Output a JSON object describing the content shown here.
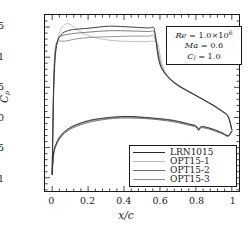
{
  "chart_data": {
    "type": "line",
    "title": "",
    "xlabel": "x/c",
    "ylabel": "Cp",
    "xlim": [
      -0.04,
      1.04
    ],
    "ylim": [
      -1.7,
      1.22
    ],
    "y_inverted": true,
    "grid": false,
    "xticks": [
      "0",
      "0.2",
      "0.4",
      "0.6",
      "0.8",
      "1"
    ],
    "xtick_values": [
      0,
      0.2,
      0.4,
      0.6,
      0.8,
      1
    ],
    "yticks": [
      "-1.5",
      "-1",
      "-0.5",
      "0",
      "0.5",
      "1"
    ],
    "ytick_values": [
      -1.5,
      -1,
      -0.5,
      0,
      0.5,
      1
    ],
    "legend_position": "bottom-right",
    "series": [
      {
        "name": "LRN1015",
        "color": "#2b2b2b",
        "upper_surface": [
          [
            0.0,
            0.95
          ],
          [
            0.004,
            0.2
          ],
          [
            0.008,
            -0.45
          ],
          [
            0.014,
            -0.9
          ],
          [
            0.022,
            -1.15
          ],
          [
            0.034,
            -1.3
          ],
          [
            0.05,
            -1.375
          ],
          [
            0.07,
            -1.42
          ],
          [
            0.1,
            -1.45
          ],
          [
            0.14,
            -1.465
          ],
          [
            0.2,
            -1.48
          ],
          [
            0.26,
            -1.5
          ],
          [
            0.32,
            -1.515
          ],
          [
            0.38,
            -1.51
          ],
          [
            0.44,
            -1.5
          ],
          [
            0.5,
            -1.49
          ],
          [
            0.54,
            -1.485
          ],
          [
            0.565,
            -1.49
          ],
          [
            0.575,
            -1.35
          ],
          [
            0.585,
            -1.1
          ],
          [
            0.6,
            -0.88
          ],
          [
            0.63,
            -0.72
          ],
          [
            0.67,
            -0.6
          ],
          [
            0.72,
            -0.5
          ],
          [
            0.78,
            -0.4
          ],
          [
            0.84,
            -0.3
          ],
          [
            0.9,
            -0.2
          ],
          [
            0.95,
            -0.1
          ],
          [
            0.98,
            -0.02
          ],
          [
            1.0,
            0.2
          ]
        ],
        "lower_surface": [
          [
            0.0,
            0.95
          ],
          [
            0.004,
            0.72
          ],
          [
            0.01,
            0.55
          ],
          [
            0.02,
            0.45
          ],
          [
            0.04,
            0.33
          ],
          [
            0.07,
            0.23
          ],
          [
            0.11,
            0.15
          ],
          [
            0.16,
            0.09
          ],
          [
            0.22,
            0.04
          ],
          [
            0.3,
            0.005
          ],
          [
            0.38,
            -0.015
          ],
          [
            0.45,
            -0.015
          ],
          [
            0.52,
            0.0
          ],
          [
            0.6,
            0.02
          ],
          [
            0.68,
            0.05
          ],
          [
            0.75,
            0.1
          ],
          [
            0.8,
            0.14
          ],
          [
            0.815,
            0.2
          ],
          [
            0.83,
            0.15
          ],
          [
            0.87,
            0.17
          ],
          [
            0.91,
            0.21
          ],
          [
            0.95,
            0.26
          ],
          [
            0.98,
            0.3
          ],
          [
            1.0,
            0.22
          ]
        ]
      },
      {
        "name": "OPT15-1",
        "color": "#b9b9b9",
        "upper_surface": [
          [
            0.0,
            0.9
          ],
          [
            0.004,
            0.15
          ],
          [
            0.01,
            -0.55
          ],
          [
            0.018,
            -1.0
          ],
          [
            0.028,
            -1.25
          ],
          [
            0.042,
            -1.42
          ],
          [
            0.06,
            -1.52
          ],
          [
            0.08,
            -1.555
          ],
          [
            0.1,
            -1.545
          ],
          [
            0.13,
            -1.48
          ],
          [
            0.17,
            -1.4
          ],
          [
            0.22,
            -1.34
          ],
          [
            0.28,
            -1.3
          ],
          [
            0.34,
            -1.275
          ],
          [
            0.4,
            -1.265
          ],
          [
            0.46,
            -1.26
          ],
          [
            0.52,
            -1.26
          ],
          [
            0.56,
            -1.265
          ],
          [
            0.585,
            -1.24
          ],
          [
            0.6,
            -1.05
          ],
          [
            0.615,
            -0.85
          ],
          [
            0.64,
            -0.7
          ],
          [
            0.68,
            -0.58
          ],
          [
            0.73,
            -0.48
          ],
          [
            0.79,
            -0.38
          ],
          [
            0.85,
            -0.28
          ],
          [
            0.9,
            -0.19
          ],
          [
            0.95,
            -0.09
          ],
          [
            0.98,
            -0.01
          ],
          [
            1.0,
            0.2
          ]
        ],
        "lower_surface": [
          [
            0.0,
            0.9
          ],
          [
            0.004,
            0.7
          ],
          [
            0.01,
            0.56
          ],
          [
            0.02,
            0.47
          ],
          [
            0.04,
            0.35
          ],
          [
            0.07,
            0.25
          ],
          [
            0.11,
            0.17
          ],
          [
            0.16,
            0.11
          ],
          [
            0.22,
            0.06
          ],
          [
            0.3,
            0.02
          ],
          [
            0.38,
            0.0
          ],
          [
            0.45,
            0.0
          ],
          [
            0.52,
            0.01
          ],
          [
            0.6,
            0.035
          ],
          [
            0.68,
            0.07
          ],
          [
            0.75,
            0.115
          ],
          [
            0.8,
            0.155
          ],
          [
            0.815,
            0.21
          ],
          [
            0.83,
            0.165
          ],
          [
            0.87,
            0.185
          ],
          [
            0.91,
            0.225
          ],
          [
            0.95,
            0.27
          ],
          [
            0.98,
            0.31
          ],
          [
            1.0,
            0.23
          ]
        ]
      },
      {
        "name": "OPT15-2",
        "color": "#6e6e6e",
        "upper_surface": [
          [
            0.0,
            0.93
          ],
          [
            0.004,
            0.18
          ],
          [
            0.008,
            -0.5
          ],
          [
            0.014,
            -0.95
          ],
          [
            0.022,
            -1.18
          ],
          [
            0.034,
            -1.3
          ],
          [
            0.05,
            -1.35
          ],
          [
            0.07,
            -1.37
          ],
          [
            0.1,
            -1.385
          ],
          [
            0.14,
            -1.4
          ],
          [
            0.2,
            -1.415
          ],
          [
            0.26,
            -1.43
          ],
          [
            0.32,
            -1.44
          ],
          [
            0.38,
            -1.44
          ],
          [
            0.44,
            -1.435
          ],
          [
            0.5,
            -1.43
          ],
          [
            0.54,
            -1.425
          ],
          [
            0.565,
            -1.43
          ],
          [
            0.578,
            -1.3
          ],
          [
            0.59,
            -1.05
          ],
          [
            0.605,
            -0.85
          ],
          [
            0.635,
            -0.7
          ],
          [
            0.675,
            -0.58
          ],
          [
            0.725,
            -0.48
          ],
          [
            0.785,
            -0.385
          ],
          [
            0.845,
            -0.285
          ],
          [
            0.9,
            -0.19
          ],
          [
            0.95,
            -0.09
          ],
          [
            0.98,
            -0.01
          ],
          [
            1.0,
            0.2
          ]
        ],
        "lower_surface": [
          [
            0.0,
            0.93
          ],
          [
            0.004,
            0.74
          ],
          [
            0.01,
            0.58
          ],
          [
            0.02,
            0.48
          ],
          [
            0.04,
            0.36
          ],
          [
            0.07,
            0.26
          ],
          [
            0.11,
            0.18
          ],
          [
            0.16,
            0.12
          ],
          [
            0.22,
            0.07
          ],
          [
            0.3,
            0.03
          ],
          [
            0.38,
            0.01
          ],
          [
            0.45,
            0.01
          ],
          [
            0.52,
            0.02
          ],
          [
            0.6,
            0.04
          ],
          [
            0.68,
            0.075
          ],
          [
            0.75,
            0.12
          ],
          [
            0.8,
            0.16
          ],
          [
            0.815,
            0.215
          ],
          [
            0.83,
            0.17
          ],
          [
            0.87,
            0.19
          ],
          [
            0.91,
            0.23
          ],
          [
            0.95,
            0.275
          ],
          [
            0.98,
            0.315
          ],
          [
            1.0,
            0.235
          ]
        ]
      },
      {
        "name": "OPT15-3",
        "color": "#8a8a8a",
        "upper_surface": [
          [
            0.0,
            0.92
          ],
          [
            0.004,
            0.12
          ],
          [
            0.008,
            -0.52
          ],
          [
            0.013,
            -0.98
          ],
          [
            0.02,
            -1.2
          ],
          [
            0.03,
            -1.26
          ],
          [
            0.045,
            -1.27
          ],
          [
            0.06,
            -1.265
          ],
          [
            0.08,
            -1.27
          ],
          [
            0.11,
            -1.29
          ],
          [
            0.15,
            -1.31
          ],
          [
            0.2,
            -1.325
          ],
          [
            0.26,
            -1.335
          ],
          [
            0.32,
            -1.34
          ],
          [
            0.38,
            -1.345
          ],
          [
            0.44,
            -1.35
          ],
          [
            0.5,
            -1.35
          ],
          [
            0.54,
            -1.35
          ],
          [
            0.565,
            -1.355
          ],
          [
            0.58,
            -1.24
          ],
          [
            0.595,
            -1.02
          ],
          [
            0.61,
            -0.84
          ],
          [
            0.64,
            -0.7
          ],
          [
            0.68,
            -0.58
          ],
          [
            0.73,
            -0.48
          ],
          [
            0.79,
            -0.38
          ],
          [
            0.85,
            -0.28
          ],
          [
            0.9,
            -0.19
          ],
          [
            0.95,
            -0.09
          ],
          [
            0.98,
            -0.01
          ],
          [
            1.0,
            0.2
          ]
        ],
        "lower_surface": [
          [
            0.0,
            0.92
          ],
          [
            0.004,
            0.73
          ],
          [
            0.01,
            0.57
          ],
          [
            0.02,
            0.46
          ],
          [
            0.04,
            0.34
          ],
          [
            0.07,
            0.24
          ],
          [
            0.11,
            0.16
          ],
          [
            0.16,
            0.1
          ],
          [
            0.22,
            0.05
          ],
          [
            0.3,
            0.015
          ],
          [
            0.38,
            -0.005
          ],
          [
            0.45,
            -0.005
          ],
          [
            0.52,
            0.005
          ],
          [
            0.6,
            0.03
          ],
          [
            0.68,
            0.06
          ],
          [
            0.75,
            0.105
          ],
          [
            0.8,
            0.145
          ],
          [
            0.815,
            0.205
          ],
          [
            0.83,
            0.158
          ],
          [
            0.87,
            0.178
          ],
          [
            0.91,
            0.218
          ],
          [
            0.95,
            0.265
          ],
          [
            0.98,
            0.305
          ],
          [
            1.0,
            0.225
          ]
        ]
      }
    ]
  },
  "axes": {
    "ylabel_text": "C",
    "ylabel_sub": "p",
    "xlabel_text": "x/c"
  },
  "annotation": {
    "re_symbol": "Re",
    "re_eq": " = 1.0×10",
    "re_exp": "6",
    "ma_symbol": "Ma",
    "ma_eq": " = 0.6",
    "cl_symbol": "C",
    "cl_sub": "l",
    "cl_eq": " = 1.0"
  },
  "legend": {
    "items": [
      {
        "label": "LRN1015",
        "color": "#2b2b2b"
      },
      {
        "label": "OPT15-1",
        "color": "#b9b9b9"
      },
      {
        "label": "OPT15-2",
        "color": "#6e6e6e"
      },
      {
        "label": "OPT15-3",
        "color": "#8a8a8a"
      }
    ]
  }
}
